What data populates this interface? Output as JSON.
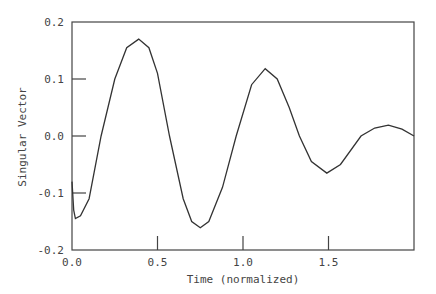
{
  "chart_data": {
    "type": "line",
    "title": "",
    "xlabel": "Time (normalized)",
    "ylabel": "Singular Vector",
    "xlim": [
      0.0,
      2.0
    ],
    "ylim": [
      -0.2,
      0.2
    ],
    "xticks": [
      0.0,
      0.5,
      1.0,
      1.5
    ],
    "xtick_labels": [
      "0.0",
      "0.5",
      "1.0",
      "1.5"
    ],
    "yticks": [
      -0.2,
      -0.1,
      0.0,
      0.1,
      0.2
    ],
    "ytick_labels": [
      "-0.2",
      "-0.1",
      "0.0",
      "0.1",
      "0.2"
    ],
    "grid": false,
    "legend": null,
    "series": [
      {
        "name": "Singular Vector",
        "color": "#333333",
        "x": [
          0.0,
          0.01,
          0.02,
          0.05,
          0.1,
          0.17,
          0.25,
          0.32,
          0.39,
          0.45,
          0.5,
          0.57,
          0.65,
          0.7,
          0.75,
          0.8,
          0.88,
          0.96,
          1.05,
          1.13,
          1.2,
          1.27,
          1.33,
          1.4,
          1.49,
          1.57,
          1.69,
          1.77,
          1.85,
          1.93,
          2.0
        ],
        "y": [
          -0.08,
          -0.13,
          -0.145,
          -0.14,
          -0.11,
          0.0,
          0.1,
          0.155,
          0.17,
          0.155,
          0.11,
          0.0,
          -0.11,
          -0.15,
          -0.161,
          -0.15,
          -0.09,
          0.0,
          0.09,
          0.118,
          0.1,
          0.05,
          0.0,
          -0.045,
          -0.065,
          -0.05,
          0.0,
          0.014,
          0.019,
          0.012,
          0.0
        ]
      }
    ]
  }
}
